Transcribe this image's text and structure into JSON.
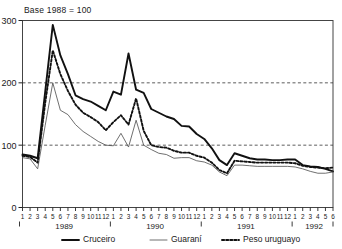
{
  "chart_data": {
    "type": "line",
    "title": "Base 1988 = 100",
    "xlabel": "",
    "ylabel": "",
    "ylim": [
      0,
      300
    ],
    "yticks": [
      0,
      100,
      200,
      300
    ],
    "gridlines": [
      100,
      200
    ],
    "grid": "horizontal-dashed",
    "legend_position": "bottom",
    "x_tick_labels": [
      "1",
      "2",
      "3",
      "4",
      "5",
      "6",
      "7",
      "8",
      "9",
      "10",
      "11",
      "12",
      "1",
      "2",
      "3",
      "4",
      "5",
      "6",
      "7",
      "8",
      "9",
      "10",
      "11",
      "12",
      "1",
      "2",
      "3",
      "4",
      "5",
      "6",
      "7",
      "8",
      "9",
      "10",
      "11",
      "12",
      "1",
      "2",
      "3",
      "4",
      "5",
      "6"
    ],
    "year_groups": [
      {
        "label": "1989",
        "start_index": 0,
        "end_index": 11
      },
      {
        "label": "1990",
        "start_index": 12,
        "end_index": 23
      },
      {
        "label": "1991",
        "start_index": 24,
        "end_index": 35
      },
      {
        "label": "1992",
        "start_index": 36,
        "end_index": 41
      }
    ],
    "x": [
      "1989-01",
      "1989-02",
      "1989-03",
      "1989-04",
      "1989-05",
      "1989-06",
      "1989-07",
      "1989-08",
      "1989-09",
      "1989-10",
      "1989-11",
      "1989-12",
      "1990-01",
      "1990-02",
      "1990-03",
      "1990-04",
      "1990-05",
      "1990-06",
      "1990-07",
      "1990-08",
      "1990-09",
      "1990-10",
      "1990-11",
      "1990-12",
      "1991-01",
      "1991-02",
      "1991-03",
      "1991-04",
      "1991-05",
      "1991-06",
      "1991-07",
      "1991-08",
      "1991-09",
      "1991-10",
      "1991-11",
      "1991-12",
      "1992-01",
      "1992-02",
      "1992-03",
      "1992-04",
      "1992-05",
      "1992-06"
    ],
    "series": [
      {
        "name": "Cruceiro",
        "style": "solid-thick",
        "color": "#111111",
        "values": [
          85,
          83,
          79,
          186,
          293,
          244,
          214,
          180,
          174,
          170,
          163,
          156,
          186,
          181,
          247,
          189,
          184,
          158,
          152,
          146,
          142,
          131,
          130,
          118,
          110,
          95,
          76,
          68,
          87,
          83,
          79,
          77,
          77,
          76,
          76,
          77,
          77,
          68,
          66,
          65,
          62,
          58
        ]
      },
      {
        "name": "Guaraní",
        "style": "solid-thin",
        "color": "#555555",
        "values": [
          80,
          78,
          62,
          132,
          200,
          156,
          149,
          133,
          122,
          114,
          106,
          100,
          99,
          119,
          97,
          140,
          100,
          93,
          87,
          85,
          79,
          80,
          80,
          75,
          73,
          68,
          57,
          51,
          68,
          68,
          67,
          66,
          66,
          66,
          66,
          66,
          65,
          62,
          58,
          55,
          55,
          57
        ]
      },
      {
        "name": "Peso uruguayo",
        "style": "dotted",
        "color": "#111111",
        "values": [
          83,
          81,
          72,
          168,
          252,
          214,
          187,
          165,
          152,
          145,
          137,
          124,
          137,
          148,
          133,
          175,
          123,
          100,
          97,
          96,
          91,
          88,
          88,
          83,
          80,
          72,
          60,
          55,
          75,
          74,
          73,
          72,
          72,
          72,
          72,
          72,
          71,
          67,
          65,
          64,
          63,
          64
        ]
      }
    ],
    "legend": [
      {
        "label": "Cruceiro",
        "style": "solid-thick"
      },
      {
        "label": "Guaraní",
        "style": "solid-thin"
      },
      {
        "label": "Peso uruguayo",
        "style": "dotted"
      }
    ]
  }
}
